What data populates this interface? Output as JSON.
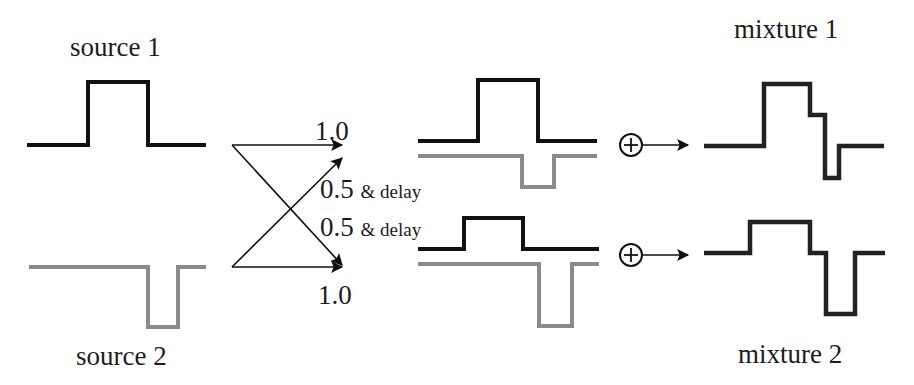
{
  "labels": {
    "source1": "source 1",
    "source2": "source 2",
    "mixture1": "mixture 1",
    "mixture2": "mixture 2"
  },
  "gains": {
    "direct_top": "1.0",
    "direct_bottom": "1.0",
    "cross_top_value": "0.5",
    "cross_top_suffix": "& delay",
    "cross_bottom_value": "0.5",
    "cross_bottom_suffix": "& delay"
  },
  "operators": {
    "sum_top": "+",
    "sum_bottom": "+"
  },
  "colors": {
    "source1_signal": "#111111",
    "source2_signal": "#8a8a8a",
    "arrow": "#111111"
  }
}
